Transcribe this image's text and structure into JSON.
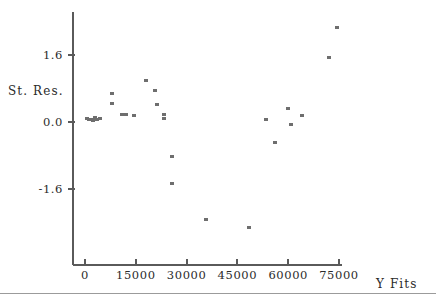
{
  "chart_data": {
    "type": "scatter",
    "title": "",
    "subtitle": "",
    "xlabel": "Y Fits",
    "ylabel": "St. Res.",
    "xticks": [
      0,
      15000,
      30000,
      45000,
      60000,
      75000
    ],
    "xtick_labels": [
      "0",
      "15000",
      "30000",
      "45000",
      "60000",
      "75000"
    ],
    "yticks": [
      1.6,
      0.0,
      -1.6
    ],
    "ytick_labels": [
      "1.6",
      "0.0",
      "-1.6"
    ],
    "xlim": [
      -2000,
      80000
    ],
    "ylim": [
      -3.6,
      2.5
    ],
    "grid": false,
    "legend": null,
    "marker": "open-square",
    "marker_color": "#6e6e6e",
    "series": [
      {
        "name": "Standardized Residuals",
        "points": [
          {
            "x": 500,
            "y": 0.08
          },
          {
            "x": 1100,
            "y": 0.07
          },
          {
            "x": 1700,
            "y": 0.05
          },
          {
            "x": 2300,
            "y": 0.03
          },
          {
            "x": 2900,
            "y": 0.1
          },
          {
            "x": 3600,
            "y": 0.06
          },
          {
            "x": 4400,
            "y": 0.09
          },
          {
            "x": 7900,
            "y": 0.69
          },
          {
            "x": 7900,
            "y": 0.43
          },
          {
            "x": 10900,
            "y": 0.18
          },
          {
            "x": 11500,
            "y": 0.17
          },
          {
            "x": 12200,
            "y": 0.19
          },
          {
            "x": 14500,
            "y": 0.15
          },
          {
            "x": 17900,
            "y": 1.0
          },
          {
            "x": 20800,
            "y": 0.74
          },
          {
            "x": 21400,
            "y": 0.41
          },
          {
            "x": 23400,
            "y": 0.17
          },
          {
            "x": 23400,
            "y": 0.09
          },
          {
            "x": 25800,
            "y": -0.83
          },
          {
            "x": 25800,
            "y": -1.46
          },
          {
            "x": 35600,
            "y": -2.32
          },
          {
            "x": 48300,
            "y": -2.52
          },
          {
            "x": 53300,
            "y": 0.06
          },
          {
            "x": 56200,
            "y": -0.5
          },
          {
            "x": 59800,
            "y": 0.32
          },
          {
            "x": 60700,
            "y": -0.07
          },
          {
            "x": 64000,
            "y": 0.16
          },
          {
            "x": 72000,
            "y": 1.54
          },
          {
            "x": 74400,
            "y": 2.26
          }
        ]
      }
    ]
  },
  "axes": {
    "y_title": "St. Res.",
    "x_title": "Y Fits"
  }
}
